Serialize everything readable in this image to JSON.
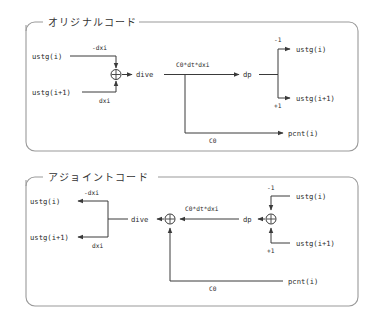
{
  "figure": {
    "title": "",
    "panels": [
      {
        "id": "original",
        "heading": "オリジナルコード",
        "labels": {
          "in_top": "ustg(i)",
          "in_bottom": "ustg(i+1)",
          "gain_top": "-dxi",
          "gain_bottom": "dxi",
          "node_glyph": "⊕",
          "var_dive": "dive",
          "edge_dive_dp": "C0*dt*dxi",
          "var_dp": "dp",
          "out_top": "ustg(i)",
          "out_bottom": "ustg(i+1)",
          "gain_out_top": "-1",
          "gain_out_bottom": "+1",
          "out_pcnt": "pcnt(i)",
          "edge_pcnt": "C0"
        }
      },
      {
        "id": "adjoint",
        "heading": "アジョイントコード",
        "labels": {
          "out_top": "ustg(i)",
          "out_bottom": "ustg(i+1)",
          "gain_top": "-dxi",
          "gain_bottom": "dxi",
          "var_dive": "dive",
          "node_glyph": "⊕",
          "edge_dp_dive": "C0*dt*dxi",
          "var_dp": "dp",
          "in_top": "ustg(i)",
          "in_bottom": "ustg(i+1)",
          "gain_in_top": "-1",
          "gain_in_bottom": "+1",
          "in_pcnt": "pcnt(i)",
          "edge_pcnt": "C0"
        }
      }
    ]
  },
  "colors": {
    "wire": "#3a3a3a",
    "panel_border": "#9a9a9a",
    "text": "#2b2b2b",
    "heading_text": "#333333",
    "background": "#ffffff"
  }
}
